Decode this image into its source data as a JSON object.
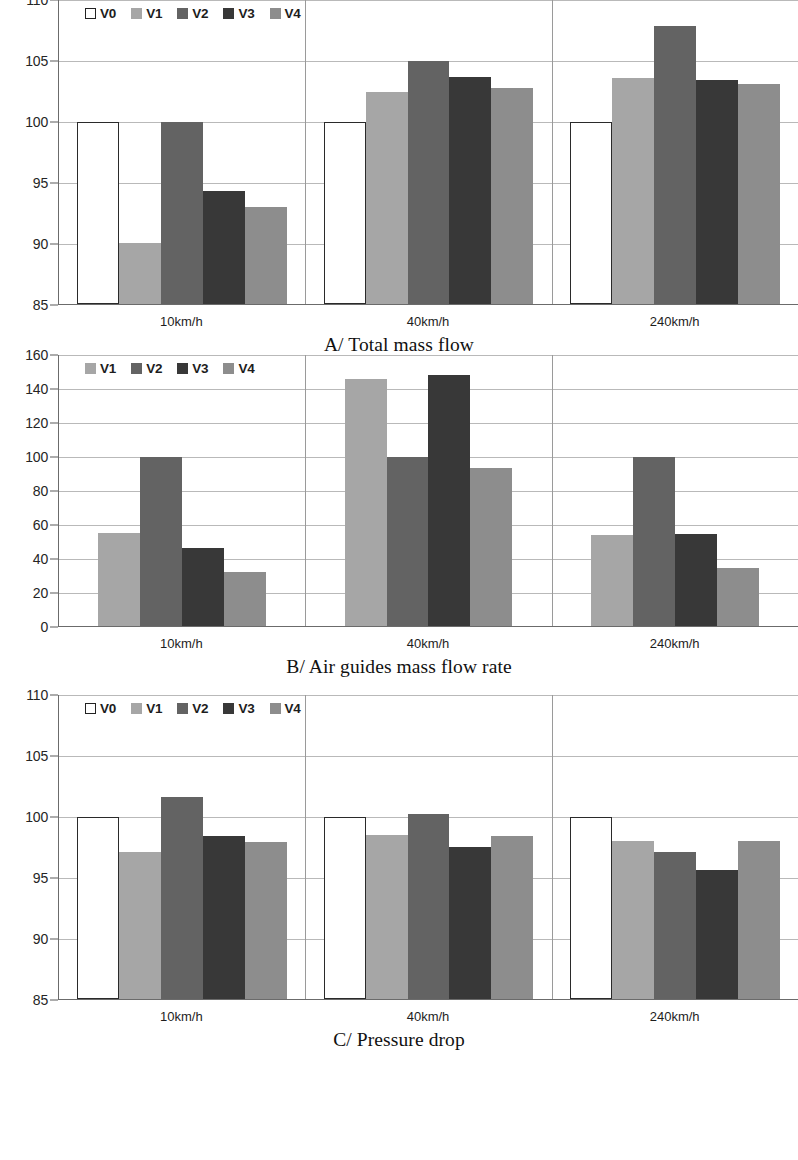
{
  "figure": {
    "background": "#ffffff",
    "series_colors": {
      "V0": "#ffffff",
      "V1": "#a6a6a6",
      "V2": "#636363",
      "V3": "#383838",
      "V4": "#8d8d8d"
    }
  },
  "chart_data": [
    {
      "type": "bar",
      "panel": "A",
      "title": "A/ Total mass flow",
      "xlabel": "",
      "ylabel": "",
      "categories": [
        "10km/h",
        "40km/h",
        "240km/h"
      ],
      "ylim": [
        85,
        110
      ],
      "yticks": [
        85,
        90,
        95,
        100,
        105,
        110
      ],
      "grid": true,
      "legend": [
        "V0",
        "V1",
        "V2",
        "V3",
        "V4"
      ],
      "legend_position": "top-left",
      "series": [
        {
          "name": "V0",
          "values": [
            100,
            100,
            100
          ]
        },
        {
          "name": "V1",
          "values": [
            90,
            102.4,
            103.6
          ]
        },
        {
          "name": "V2",
          "values": [
            100,
            105,
            107.9
          ]
        },
        {
          "name": "V3",
          "values": [
            94.3,
            103.7,
            103.4
          ]
        },
        {
          "name": "V4",
          "values": [
            93,
            102.8,
            103.1
          ]
        }
      ]
    },
    {
      "type": "bar",
      "panel": "B",
      "title": "B/ Air guides mass flow rate",
      "xlabel": "",
      "ylabel": "",
      "categories": [
        "10km/h",
        "40km/h",
        "240km/h"
      ],
      "ylim": [
        0,
        160
      ],
      "yticks": [
        0,
        20,
        40,
        60,
        80,
        100,
        120,
        140,
        160
      ],
      "grid": true,
      "legend": [
        "V1",
        "V2",
        "V3",
        "V4"
      ],
      "legend_position": "top-left",
      "series": [
        {
          "name": "V1",
          "values": [
            55,
            146,
            54
          ]
        },
        {
          "name": "V2",
          "values": [
            100,
            100,
            100
          ]
        },
        {
          "name": "V3",
          "values": [
            46,
            148,
            54.5
          ]
        },
        {
          "name": "V4",
          "values": [
            32,
            93,
            34
          ]
        }
      ]
    },
    {
      "type": "bar",
      "panel": "C",
      "title": "C/ Pressure drop",
      "xlabel": "",
      "ylabel": "",
      "categories": [
        "10km/h",
        "40km/h",
        "240km/h"
      ],
      "ylim": [
        85,
        110
      ],
      "yticks": [
        85,
        90,
        95,
        100,
        105,
        110
      ],
      "grid": true,
      "legend": [
        "V0",
        "V1",
        "V2",
        "V3",
        "V4"
      ],
      "legend_position": "top-left",
      "series": [
        {
          "name": "V0",
          "values": [
            100,
            100,
            100
          ]
        },
        {
          "name": "V1",
          "values": [
            97.1,
            98.5,
            98.0
          ]
        },
        {
          "name": "V2",
          "values": [
            101.6,
            100.2,
            97.1
          ]
        },
        {
          "name": "V3",
          "values": [
            98.4,
            97.5,
            95.6
          ]
        },
        {
          "name": "V4",
          "values": [
            97.9,
            98.4,
            98.0
          ]
        }
      ]
    }
  ]
}
